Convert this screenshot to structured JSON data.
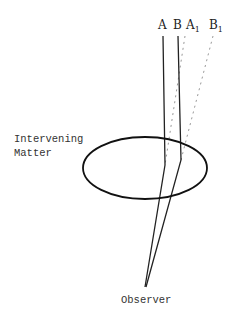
{
  "diagram": {
    "labels": {
      "a": "A",
      "b": "B",
      "a1": "A",
      "a1_sub": "1",
      "b1": "B",
      "b1_sub": "1",
      "matter_line1": "Intervening",
      "matter_line2": "Matter",
      "observer": "Observer"
    },
    "colors": {
      "solid_ray": "#222222",
      "dashed_ray": "#999999",
      "ellipse": "#111111"
    }
  }
}
